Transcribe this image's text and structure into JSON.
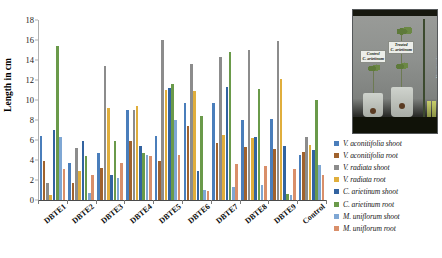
{
  "chart_data": {
    "type": "bar",
    "title": "",
    "xlabel": "",
    "ylabel": "Length in cm",
    "ylim": [
      0,
      18
    ],
    "ytick_step": 2,
    "yticks": [
      0,
      2,
      4,
      6,
      8,
      10,
      12,
      14,
      16,
      18
    ],
    "grid": false,
    "legend_position": "right",
    "categories": [
      "DBTE1",
      "DBTE2",
      "DBTE3",
      "DBTE4",
      "DBTE5",
      "DBTE6",
      "DBTE7",
      "DBTE8",
      "DBTE9",
      "Control"
    ],
    "series": [
      {
        "name": "V. aconitifolia shoot",
        "color": "#4a7ebb",
        "values": [
          6.4,
          3.7,
          4.7,
          9.0,
          6.4,
          9.7,
          9.7,
          8.0,
          8.1,
          4.5
        ]
      },
      {
        "name": "V. aconitifolia root",
        "color": "#a0622d",
        "values": [
          3.9,
          1.7,
          3.2,
          5.9,
          3.9,
          7.4,
          5.7,
          5.3,
          5.1,
          4.8
        ]
      },
      {
        "name": "V. radiata shoot",
        "color": "#8c8c8c",
        "values": [
          1.7,
          5.2,
          13.4,
          9.0,
          16.0,
          13.6,
          14.3,
          15.0,
          15.9,
          6.3
        ]
      },
      {
        "name": "V. radiata root",
        "color": "#e0ae3c",
        "values": [
          0.5,
          2.9,
          9.2,
          9.4,
          11.0,
          10.9,
          6.5,
          6.2,
          12.1,
          5.5
        ]
      },
      {
        "name": "C. arietinum shoot",
        "color": "#3263a0",
        "values": [
          7.0,
          5.9,
          2.5,
          5.4,
          11.2,
          2.9,
          11.3,
          6.3,
          5.4,
          5.0
        ]
      },
      {
        "name": "C. arietinum root",
        "color": "#6a9a4a",
        "values": [
          15.4,
          4.4,
          5.9,
          4.7,
          11.6,
          8.4,
          14.8,
          11.1,
          0.6,
          10.0
        ]
      },
      {
        "name": "M. uniflorum shoot",
        "color": "#7fa7d4",
        "values": [
          6.3,
          0.7,
          2.2,
          4.5,
          8.0,
          1.0,
          1.3,
          1.5,
          0.5,
          3.5
        ]
      },
      {
        "name": "M. uniflorum root",
        "color": "#d98f6a",
        "values": [
          3.1,
          2.5,
          3.7,
          4.4,
          4.5,
          0.9,
          3.6,
          3.4,
          3.1,
          2.5
        ]
      }
    ]
  },
  "legend": {
    "items": [
      {
        "label": "V. aconitifolia shoot",
        "color": "#4a7ebb"
      },
      {
        "label": "V. aconitifolia root",
        "color": "#a0622d"
      },
      {
        "label": "V. radiata shoot",
        "color": "#8c8c8c"
      },
      {
        "label": "V. radiata root",
        "color": "#e0ae3c"
      },
      {
        "label": "C. arietinum shoot",
        "color": "#3263a0"
      },
      {
        "label": "C. arietinum root",
        "color": "#6a9a4a"
      },
      {
        "label": "M. uniflorum shoot",
        "color": "#7fa7d4"
      },
      {
        "label": "M. uniflorum root",
        "color": "#d98f6a"
      }
    ]
  },
  "photo": {
    "control_label_line1": "Control",
    "control_label_line2": "C. arietinum",
    "treated_label_line1": "Treated",
    "treated_label_line2": "C. arietinum",
    "side_caption": "Measuring scale"
  }
}
